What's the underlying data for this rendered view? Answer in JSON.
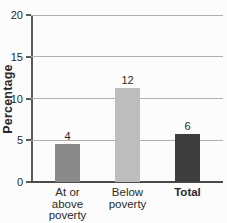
{
  "colors": {
    "background": "#fcfcfc",
    "gridline": "#b0b0b0",
    "axis": "#5a5a5a",
    "text": "#2a2a2a"
  },
  "chart_data": {
    "type": "bar",
    "title": "",
    "xlabel": "",
    "ylabel": "Percentage",
    "ylim": [
      0,
      20
    ],
    "yticks": [
      0,
      5,
      10,
      15,
      20
    ],
    "grid": "horizontal",
    "legend": "none",
    "categories": [
      "At or above poverty",
      "Below poverty",
      "Total"
    ],
    "category_lines": [
      [
        "At or",
        "above",
        "poverty"
      ],
      [
        "Below",
        "poverty"
      ],
      [
        "Total"
      ]
    ],
    "category_bold": [
      false,
      false,
      true
    ],
    "values": [
      4,
      12,
      6
    ],
    "drawn_bar_heights": [
      4.5,
      11.2,
      5.8
    ],
    "bar_colors": [
      "#8a8a8a",
      "#bdbdbd",
      "#3d3d3d"
    ]
  }
}
